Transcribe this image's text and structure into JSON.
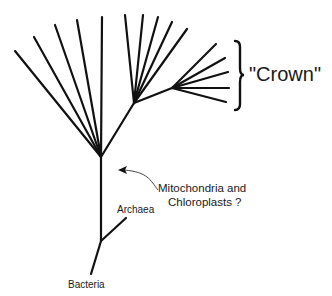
{
  "diagram": {
    "type": "phylogenetic-tree",
    "labels": {
      "crown": "\"Crown\"",
      "organelles_line1": "Mitochondria and",
      "organelles_line2": "Chloroplasts ?",
      "archaea": "Archaea",
      "bacteria": "Bacteria"
    },
    "colors": {
      "line": "#111111",
      "text": "#1a1a1a",
      "background": "#ffffff"
    }
  }
}
